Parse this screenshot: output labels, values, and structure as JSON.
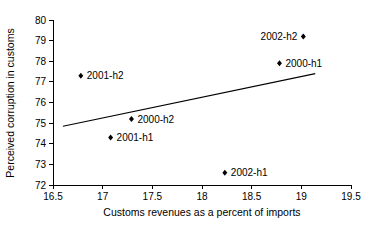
{
  "chart_data": {
    "type": "scatter",
    "title": "",
    "xlabel": "Customs revenues as a percent of imports",
    "ylabel": "Perceived corruption in customs",
    "xlim": [
      16.5,
      19.5
    ],
    "ylim": [
      72,
      80
    ],
    "xticks": [
      "16.5",
      "17",
      "17.5",
      "18",
      "18.5",
      "19",
      "19.5"
    ],
    "xtick_values": [
      16.5,
      17,
      17.5,
      18,
      18.5,
      19,
      19.5
    ],
    "yticks": [
      "72",
      "73",
      "74",
      "75",
      "76",
      "77",
      "78",
      "79",
      "80"
    ],
    "ytick_values": [
      72,
      73,
      74,
      75,
      76,
      77,
      78,
      79,
      80
    ],
    "grid": false,
    "legend": "none",
    "marker_style": "filled-diamond",
    "points": [
      {
        "label": "2001-h2",
        "x": 16.78,
        "y": 77.3,
        "label_side": "right"
      },
      {
        "label": "2001-h1",
        "x": 17.08,
        "y": 74.3,
        "label_side": "right"
      },
      {
        "label": "2000-h2",
        "x": 17.29,
        "y": 75.2,
        "label_side": "right"
      },
      {
        "label": "2002-h1",
        "x": 18.23,
        "y": 72.6,
        "label_side": "right"
      },
      {
        "label": "2000-h1",
        "x": 18.78,
        "y": 77.9,
        "label_side": "right"
      },
      {
        "label": "2002-h2",
        "x": 19.02,
        "y": 79.2,
        "label_side": "left"
      }
    ],
    "trend_line": {
      "type": "linear-fit",
      "x0": 16.6,
      "y0": 74.85,
      "x1": 19.14,
      "y1": 77.4
    }
  }
}
